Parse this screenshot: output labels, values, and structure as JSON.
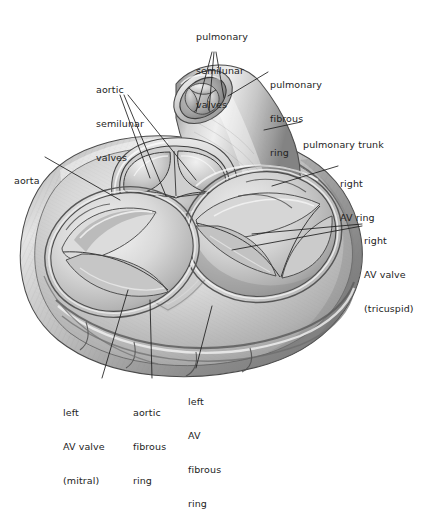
{
  "figure": {
    "view": "superior view of heart valves",
    "style": "grayscale pencil/airbrush anatomical illustration",
    "background_color": "#ffffff",
    "ink_color": "#232323"
  },
  "labels": [
    {
      "id": "pulmonary-semilunar-valves",
      "lines": [
        "pulmonary",
        "semilunar",
        "valves"
      ],
      "line1": "pulmonary",
      "line2": "semilunar",
      "line3": "valves",
      "x": 196,
      "y": 8,
      "align": "left",
      "leader_count": 3
    },
    {
      "id": "aortic-semilunar-valves",
      "lines": [
        "aortic",
        "semilunar",
        "valves"
      ],
      "line1": "aortic",
      "line2": "semilunar",
      "line3": "valves",
      "x": 96,
      "y": 61,
      "align": "left",
      "leader_count": 3
    },
    {
      "id": "pulmonary-fibrous-ring",
      "lines": [
        "pulmonary",
        "fibrous",
        "ring"
      ],
      "line1": "pulmonary",
      "line2": "fibrous",
      "line3": "ring",
      "x": 270,
      "y": 56,
      "align": "left",
      "leader_count": 1
    },
    {
      "id": "pulmonary-trunk",
      "lines": [
        "pulmonary trunk"
      ],
      "line1": "pulmonary trunk",
      "x": 303,
      "y": 116,
      "align": "left",
      "leader_count": 1
    },
    {
      "id": "right-av-ring",
      "lines": [
        "right",
        "AV ring"
      ],
      "line1": "right",
      "line2": "AV ring",
      "x": 340,
      "y": 155,
      "align": "left",
      "leader_count": 1
    },
    {
      "id": "right-av-valve-tricuspid",
      "lines": [
        "right",
        "AV valve",
        "(tricuspid)"
      ],
      "line1": "right",
      "line2": "AV valve",
      "line3": "(tricuspid)",
      "x": 364,
      "y": 212,
      "align": "left",
      "leader_count": 2
    },
    {
      "id": "aorta",
      "lines": [
        "aorta"
      ],
      "line1": "aorta",
      "x": 14,
      "y": 152,
      "align": "left",
      "leader_count": 1
    },
    {
      "id": "left-av-valve-mitral",
      "lines": [
        "left",
        "AV valve",
        "(mitral)"
      ],
      "line1": "left",
      "line2": "AV valve",
      "line3": "(mitral)",
      "x": 63,
      "y": 384,
      "align": "left",
      "leader_count": 1
    },
    {
      "id": "aortic-fibrous-ring",
      "lines": [
        "aortic",
        "fibrous",
        "ring"
      ],
      "line1": "aortic",
      "line2": "fibrous",
      "line3": "ring",
      "x": 133,
      "y": 384,
      "align": "left",
      "leader_count": 1
    },
    {
      "id": "left-av-fibrous-ring",
      "lines": [
        "left",
        "AV",
        "fibrous",
        "ring"
      ],
      "line1": "left",
      "line2": "AV",
      "line3": "fibrous",
      "line4": "ring",
      "x": 188,
      "y": 373,
      "align": "left",
      "leader_count": 1
    }
  ],
  "structures": [
    "pulmonary semilunar valves",
    "aortic semilunar valves",
    "pulmonary fibrous ring",
    "pulmonary trunk",
    "right AV ring",
    "right AV valve (tricuspid)",
    "aorta",
    "left AV valve (mitral)",
    "aortic fibrous ring",
    "left AV fibrous ring"
  ]
}
